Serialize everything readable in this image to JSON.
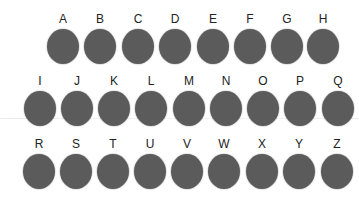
{
  "colors": {
    "dot": "#5b5b5b",
    "label": "#222222",
    "background": "#ffffff"
  },
  "rows": [
    {
      "letters": [
        "A",
        "B",
        "C",
        "D",
        "E",
        "F",
        "G",
        "H"
      ]
    },
    {
      "letters": [
        "I",
        "J",
        "K",
        "L",
        "M",
        "N",
        "O",
        "P",
        "Q"
      ]
    },
    {
      "letters": [
        "R",
        "S",
        "T",
        "U",
        "V",
        "W",
        "X",
        "Y",
        "Z"
      ]
    }
  ]
}
